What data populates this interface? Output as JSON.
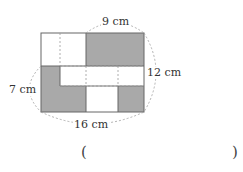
{
  "figure": {
    "dimensions": {
      "top": "9 cm",
      "right": "12 cm",
      "left": "7 cm",
      "bottom": "16 cm"
    },
    "colors": {
      "shade": "#a9a9a9",
      "outline": "#666666",
      "dashed": "#9a9a9a"
    }
  },
  "answer": {
    "open_paren": "(",
    "close_paren": ")",
    "value": ""
  }
}
